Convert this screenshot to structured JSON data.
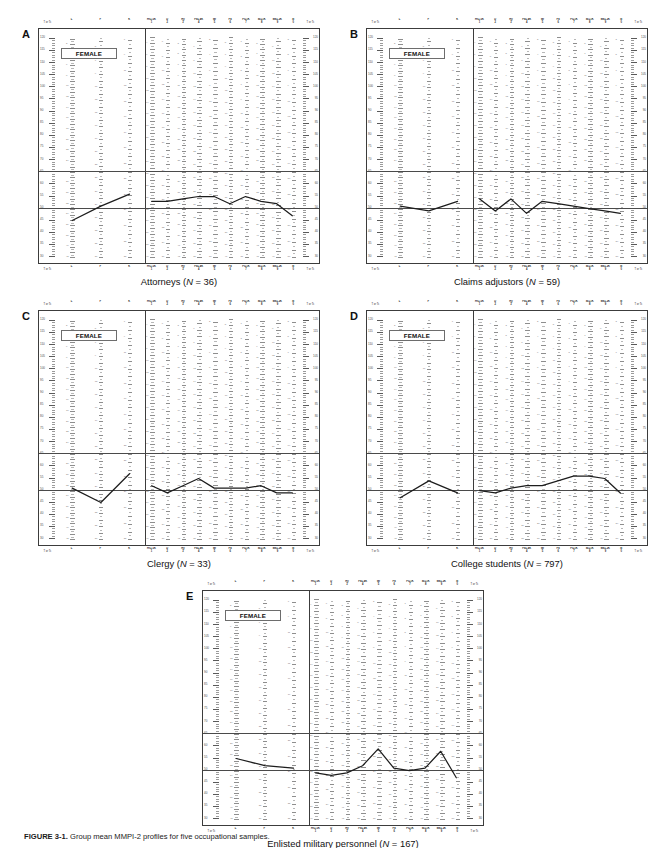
{
  "figure": {
    "caption_label": "FIGURE 3-1.",
    "caption_text": "Group mean MMPI-2 profiles for five occupational samples.",
    "sex_label": "FEMALE",
    "rail_header": "T or Tc",
    "rail_footer": "T or Tc"
  },
  "scales": {
    "validity": [
      {
        "name": "L",
        "number": ""
      },
      {
        "name": "F",
        "number": ""
      },
      {
        "name": "K",
        "number": ""
      }
    ],
    "clinical": [
      {
        "name": "Hs+.5K",
        "number": "1"
      },
      {
        "name": "D",
        "number": "2"
      },
      {
        "name": "Hy",
        "number": "3"
      },
      {
        "name": "Pd+.4K",
        "number": "4"
      },
      {
        "name": "Mf",
        "number": "5"
      },
      {
        "name": "Pa",
        "number": "6"
      },
      {
        "name": "Pt+1K",
        "number": "7"
      },
      {
        "name": "Sc+1K",
        "number": "8"
      },
      {
        "name": "Ma+.2K",
        "number": "9"
      },
      {
        "name": "Si",
        "number": "0"
      }
    ]
  },
  "axis": {
    "t_min": 28,
    "t_max": 122,
    "rail_ticks": [
      30,
      35,
      40,
      45,
      50,
      55,
      60,
      65,
      70,
      75,
      80,
      85,
      90,
      95,
      100,
      105,
      110,
      115,
      120
    ],
    "rail_major_labels": [
      30,
      35,
      40,
      45,
      50,
      55,
      60,
      65,
      70,
      75,
      80,
      85,
      90,
      95,
      100,
      105,
      110,
      115,
      120
    ],
    "reference_lines": [
      65,
      50
    ],
    "reference_line_labels": [
      "65",
      "50"
    ]
  },
  "panels": [
    {
      "letter": "A",
      "caption_name": "Attorneys",
      "caption_n": "N",
      "caption_eq": " = 36",
      "caption_full": "Attorneys (N = 36)",
      "profile": {
        "validity": [
          44,
          50,
          55
        ],
        "clinical": [
          52,
          52,
          53,
          54,
          54,
          51,
          54,
          52,
          51,
          46
        ]
      }
    },
    {
      "letter": "B",
      "caption_name": "Claims adjustors",
      "caption_n": "N",
      "caption_eq": " = 59",
      "caption_full": "Claims adjustors (N = 59)",
      "profile": {
        "validity": [
          50,
          48,
          52
        ],
        "clinical": [
          53,
          48,
          53,
          47,
          52,
          51,
          50,
          49,
          48,
          47
        ]
      }
    },
    {
      "letter": "C",
      "caption_name": "Clergy",
      "caption_n": "N",
      "caption_eq": " = 33",
      "caption_full": "Clergy (N = 33)",
      "profile": {
        "validity": [
          50,
          44,
          56
        ],
        "clinical": [
          51,
          48,
          51,
          54,
          50,
          50,
          50,
          51,
          48,
          48
        ]
      }
    },
    {
      "letter": "D",
      "caption_name": "College students",
      "caption_n": "N",
      "caption_eq": " = 797",
      "caption_full": "College students (N = 797)",
      "profile": {
        "validity": [
          46,
          53,
          48
        ],
        "clinical": [
          49,
          48,
          50,
          51,
          51,
          53,
          55,
          55,
          54,
          48
        ]
      }
    },
    {
      "letter": "E",
      "caption_name": "Enlisted military personnel",
      "caption_n": "N",
      "caption_eq": " = 167",
      "caption_full": "Enlisted military personnel (N = 167)",
      "profile": {
        "validity": [
          54,
          51,
          50
        ],
        "clinical": [
          48,
          47,
          48,
          51,
          58,
          50,
          49,
          50,
          57,
          46
        ]
      }
    }
  ],
  "chart_data": {
    "type": "line",
    "title": "Group mean MMPI-2 profiles for five occupational samples",
    "xlabel": "",
    "ylabel": "T or Tc",
    "ylim": [
      28,
      122
    ],
    "grid": true,
    "legend": "none",
    "categories": [
      "L",
      "F",
      "K",
      "Hs+.5K (1)",
      "D (2)",
      "Hy (3)",
      "Pd+.4K (4)",
      "Mf (5)",
      "Pa (6)",
      "Pt+1K (7)",
      "Sc+1K (8)",
      "Ma+.2K (9)",
      "Si (0)"
    ],
    "annotations": [
      "FEMALE",
      "reference line T=65",
      "reference line T=50"
    ],
    "series": [
      {
        "name": "Attorneys (N = 36)",
        "values": [
          44,
          50,
          55,
          52,
          52,
          53,
          54,
          54,
          51,
          54,
          52,
          51,
          46
        ]
      },
      {
        "name": "Claims adjustors (N = 59)",
        "values": [
          50,
          48,
          52,
          53,
          48,
          53,
          47,
          52,
          51,
          50,
          49,
          48,
          47
        ]
      },
      {
        "name": "Clergy (N = 33)",
        "values": [
          50,
          44,
          56,
          51,
          48,
          51,
          54,
          50,
          50,
          50,
          51,
          48,
          48
        ]
      },
      {
        "name": "College students (N = 797)",
        "values": [
          46,
          53,
          48,
          49,
          48,
          50,
          51,
          51,
          53,
          55,
          55,
          54,
          48
        ]
      },
      {
        "name": "Enlisted military personnel (N = 167)",
        "values": [
          54,
          51,
          50,
          48,
          47,
          48,
          51,
          58,
          50,
          49,
          50,
          57,
          46
        ]
      }
    ]
  }
}
